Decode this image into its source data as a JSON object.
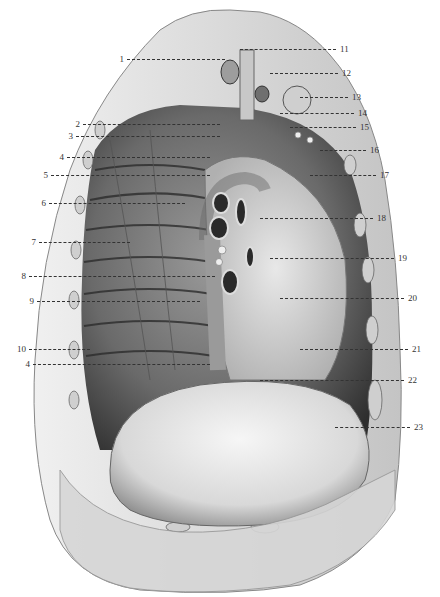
{
  "figure": {
    "type": "anatomical-illustration",
    "style": "grayscale engraving"
  },
  "labels_left": [
    {
      "n": "1",
      "x": 118,
      "y": 59,
      "to": 225
    },
    {
      "n": "2",
      "x": 74,
      "y": 124,
      "to": 220
    },
    {
      "n": "3",
      "x": 67,
      "y": 136,
      "to": 220
    },
    {
      "n": "4",
      "x": 58,
      "y": 157,
      "to": 210
    },
    {
      "n": "5",
      "x": 42,
      "y": 175,
      "to": 210
    },
    {
      "n": "6",
      "x": 40,
      "y": 203,
      "to": 185
    },
    {
      "n": "7",
      "x": 30,
      "y": 242,
      "to": 130
    },
    {
      "n": "8",
      "x": 20,
      "y": 276,
      "to": 215
    },
    {
      "n": "9",
      "x": 28,
      "y": 301,
      "to": 200
    },
    {
      "n": "10",
      "x": 20,
      "y": 349,
      "to": 90
    },
    {
      "n": "4",
      "x": 24,
      "y": 364,
      "to": 210
    }
  ],
  "labels_right": [
    {
      "n": "11",
      "x": 340,
      "y": 49,
      "from": 240
    },
    {
      "n": "12",
      "x": 342,
      "y": 73,
      "from": 270
    },
    {
      "n": "13",
      "x": 352,
      "y": 97,
      "from": 300
    },
    {
      "n": "14",
      "x": 358,
      "y": 113,
      "from": 280
    },
    {
      "n": "15",
      "x": 360,
      "y": 127,
      "from": 290
    },
    {
      "n": "16",
      "x": 370,
      "y": 150,
      "from": 320
    },
    {
      "n": "17",
      "x": 380,
      "y": 175,
      "from": 310
    },
    {
      "n": "18",
      "x": 377,
      "y": 218,
      "from": 260
    },
    {
      "n": "19",
      "x": 398,
      "y": 258,
      "from": 270
    },
    {
      "n": "20",
      "x": 408,
      "y": 298,
      "from": 280
    },
    {
      "n": "21",
      "x": 412,
      "y": 349,
      "from": 300
    },
    {
      "n": "22",
      "x": 408,
      "y": 380,
      "from": 260
    },
    {
      "n": "23",
      "x": 414,
      "y": 427,
      "from": 335
    }
  ],
  "colors": {
    "background": "#ffffff",
    "tissue_light": "#e6e6e6",
    "tissue_mid": "#a8a8a8",
    "tissue_dark": "#3c3c3c",
    "label_text": "#333333"
  }
}
